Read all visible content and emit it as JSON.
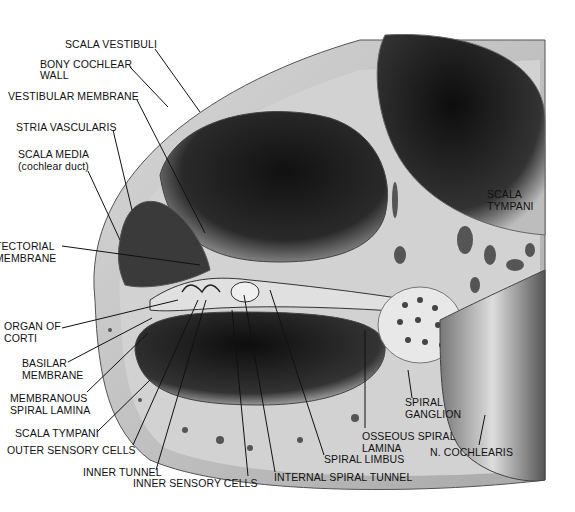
{
  "diagram": {
    "labels": {
      "scala_vestibuli": "SCALA VESTIBULI",
      "bony_cochlear_wall_1": "BONY COCHLEAR",
      "bony_cochlear_wall_2": "WALL",
      "vestibular_membrane": "VESTIBULAR MEMBRANE",
      "stria_vascularis": "STRIA VASCULARIS",
      "scala_media_1": "SCALA MEDIA",
      "scala_media_2": "(cochlear duct)",
      "tectorial_membrane_1": "TECTORIAL",
      "tectorial_membrane_2": "MEMBRANE",
      "organ_of_corti_1": "ORGAN OF",
      "organ_of_corti_2": "CORTI",
      "basilar_membrane_1": "BASILAR",
      "basilar_membrane_2": "MEMBRANE",
      "membranous_spiral_lamina_1": "MEMBRANOUS",
      "membranous_spiral_lamina_2": "SPIRAL LAMINA",
      "scala_tympani_left": "SCALA TYMPANI",
      "outer_sensory_cells": "OUTER SENSORY CELLS",
      "inner_tunnel": "INNER TUNNEL",
      "inner_sensory_cells": "INNER SENSORY CELLS",
      "internal_spiral_tunnel": "INTERNAL SPIRAL TUNNEL",
      "spiral_limbus": "SPIRAL LIMBUS",
      "osseous_spiral_lamina_1": "OSSEOUS SPIRAL",
      "osseous_spiral_lamina_2": "LAMINA",
      "spiral_ganglion_1": "SPIRAL",
      "spiral_ganglion_2": "GANGLION",
      "n_cochlearis": "N. COCHLEARIS",
      "scala_tympani_right_1": "SCALA",
      "scala_tympani_right_2": "TYMPANI"
    },
    "colors": {
      "bone": "#c9c9c9",
      "chamber_dark": "#1a1a1a",
      "membrane": "#e6e6e6",
      "line": "#111111"
    }
  }
}
